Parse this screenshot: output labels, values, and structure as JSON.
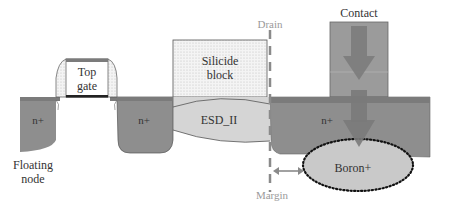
{
  "diagram": {
    "type": "semiconductor cross-section",
    "labels": {
      "top_gate_line1": "Top",
      "top_gate_line2": "gate",
      "silicide_line1": "Silicide",
      "silicide_line2": "block",
      "esd": "ESD_II",
      "drain": "Drain",
      "contact": "Contact",
      "n_left": "n+",
      "n_middle": "n+",
      "n_right": "n+",
      "boron": "Boron+",
      "floating_line1": "Floating",
      "floating_line2": "node",
      "margin": "Margin"
    },
    "colors": {
      "n_region": "#8c8c8c",
      "surface_strip": "#7a7a7a",
      "esd_fill": "#d4d4d4",
      "boron_fill": "#c8c8c8",
      "contact_fill": "#999999",
      "arrow_fill": "#777777",
      "drain_line": "#8a8a8a",
      "silicide_fill": "#efefef"
    }
  }
}
